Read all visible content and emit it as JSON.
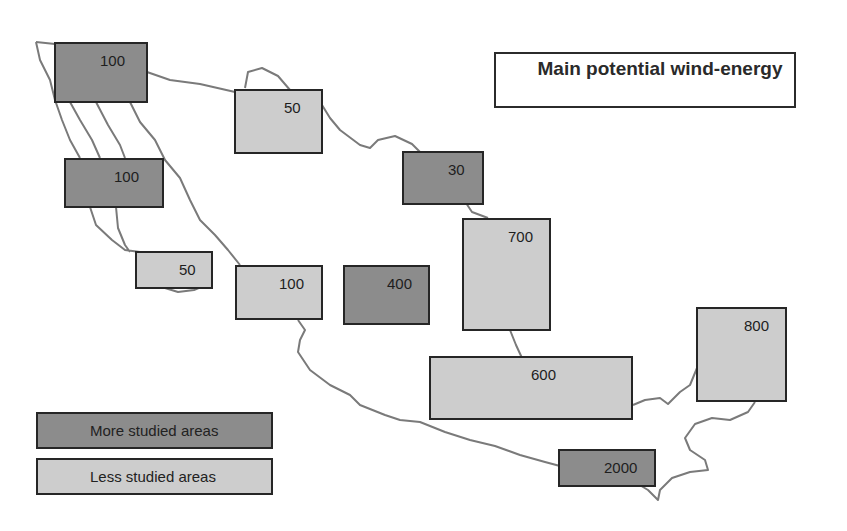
{
  "title": "Main potential wind-energy",
  "legend": {
    "more_studied": {
      "label": "More studied areas",
      "color": "#8c8c8c"
    },
    "less_studied": {
      "label": "Less studied areas",
      "color": "#cdcdcd"
    }
  },
  "colors": {
    "outline": "#7a7a7a",
    "border": "#262626",
    "more": "#8c8c8c",
    "less": "#cdcdcd"
  },
  "regions": [
    {
      "value": "100",
      "category": "more"
    },
    {
      "value": "50",
      "category": "less"
    },
    {
      "value": "100",
      "category": "more"
    },
    {
      "value": "30",
      "category": "more"
    },
    {
      "value": "700",
      "category": "less"
    },
    {
      "value": "50",
      "category": "less"
    },
    {
      "value": "100",
      "category": "less"
    },
    {
      "value": "400",
      "category": "more"
    },
    {
      "value": "800",
      "category": "less"
    },
    {
      "value": "600",
      "category": "less"
    },
    {
      "value": "2000",
      "category": "more"
    }
  ]
}
